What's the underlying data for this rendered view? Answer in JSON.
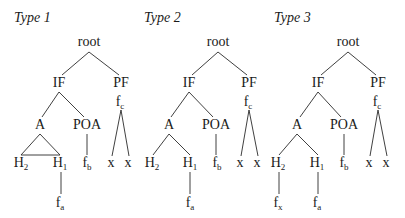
{
  "diagram": {
    "trees": [
      {
        "label": "Type 1",
        "label_pos": [
          14,
          22
        ],
        "nodes": [
          {
            "id": "root",
            "text": "root",
            "sub": "",
            "x": 89,
            "y": 46
          },
          {
            "id": "IF",
            "text": "IF",
            "sub": "",
            "x": 59,
            "y": 87
          },
          {
            "id": "PF",
            "text": "PF",
            "sub": "",
            "x": 121,
            "y": 87
          },
          {
            "id": "fc",
            "text": "f",
            "sub": "c",
            "x": 120,
            "y": 106
          },
          {
            "id": "A",
            "text": "A",
            "sub": "",
            "x": 40,
            "y": 129
          },
          {
            "id": "POA",
            "text": "POA",
            "sub": "",
            "x": 87,
            "y": 129
          },
          {
            "id": "H2",
            "text": "H",
            "sub": "2",
            "x": 21,
            "y": 167
          },
          {
            "id": "H1",
            "text": "H",
            "sub": "1",
            "x": 60,
            "y": 167
          },
          {
            "id": "fb",
            "text": "f",
            "sub": "b",
            "x": 87,
            "y": 167
          },
          {
            "id": "x1",
            "text": "x",
            "sub": "",
            "x": 111,
            "y": 167
          },
          {
            "id": "x2",
            "text": "x",
            "sub": "",
            "x": 128,
            "y": 167
          },
          {
            "id": "fa",
            "text": "f",
            "sub": "a",
            "x": 60,
            "y": 207
          }
        ],
        "edges": [
          [
            89,
            52,
            62,
            75
          ],
          [
            89,
            52,
            119,
            75
          ],
          [
            59,
            92,
            42,
            117
          ],
          [
            59,
            92,
            84,
            117
          ],
          [
            40,
            134,
            21,
            155
          ],
          [
            40,
            134,
            60,
            155
          ],
          [
            21,
            155,
            60,
            155
          ],
          [
            87,
            134,
            87,
            155
          ],
          [
            121,
            110,
            112,
            156
          ],
          [
            121,
            110,
            129,
            156
          ],
          [
            61,
            172,
            61,
            194
          ]
        ]
      },
      {
        "label": "Type 2",
        "label_pos": [
          144,
          22
        ],
        "nodes": [
          {
            "id": "root",
            "text": "root",
            "sub": "",
            "x": 218,
            "y": 46
          },
          {
            "id": "IF",
            "text": "IF",
            "sub": "",
            "x": 189,
            "y": 87
          },
          {
            "id": "PF",
            "text": "PF",
            "sub": "",
            "x": 249,
            "y": 87
          },
          {
            "id": "fc",
            "text": "f",
            "sub": "c",
            "x": 248,
            "y": 106
          },
          {
            "id": "A",
            "text": "A",
            "sub": "",
            "x": 169,
            "y": 129
          },
          {
            "id": "POA",
            "text": "POA",
            "sub": "",
            "x": 216,
            "y": 129
          },
          {
            "id": "H2",
            "text": "H",
            "sub": "2",
            "x": 152,
            "y": 167
          },
          {
            "id": "H1",
            "text": "H",
            "sub": "1",
            "x": 190,
            "y": 167
          },
          {
            "id": "fb",
            "text": "f",
            "sub": "b",
            "x": 217,
            "y": 167
          },
          {
            "id": "x1",
            "text": "x",
            "sub": "",
            "x": 240,
            "y": 167
          },
          {
            "id": "x2",
            "text": "x",
            "sub": "",
            "x": 257,
            "y": 167
          },
          {
            "id": "fa",
            "text": "f",
            "sub": "a",
            "x": 190,
            "y": 207
          }
        ],
        "edges": [
          [
            218,
            52,
            192,
            75
          ],
          [
            218,
            52,
            247,
            75
          ],
          [
            189,
            92,
            171,
            117
          ],
          [
            189,
            92,
            213,
            117
          ],
          [
            169,
            134,
            153,
            155
          ],
          [
            169,
            134,
            190,
            155
          ],
          [
            216,
            134,
            216,
            155
          ],
          [
            249,
            110,
            241,
            156
          ],
          [
            249,
            110,
            258,
            156
          ],
          [
            190,
            172,
            190,
            194
          ]
        ]
      },
      {
        "label": "Type 3",
        "label_pos": [
          274,
          22
        ],
        "nodes": [
          {
            "id": "root",
            "text": "root",
            "sub": "",
            "x": 348,
            "y": 46
          },
          {
            "id": "IF",
            "text": "IF",
            "sub": "",
            "x": 318,
            "y": 87
          },
          {
            "id": "PF",
            "text": "PF",
            "sub": "",
            "x": 378,
            "y": 87
          },
          {
            "id": "fc",
            "text": "f",
            "sub": "c",
            "x": 377,
            "y": 106
          },
          {
            "id": "A",
            "text": "A",
            "sub": "",
            "x": 297,
            "y": 129
          },
          {
            "id": "POA",
            "text": "POA",
            "sub": "",
            "x": 344,
            "y": 129
          },
          {
            "id": "H2",
            "text": "H",
            "sub": "2",
            "x": 278,
            "y": 167
          },
          {
            "id": "H1",
            "text": "H",
            "sub": "1",
            "x": 317,
            "y": 167
          },
          {
            "id": "fb",
            "text": "f",
            "sub": "b",
            "x": 344,
            "y": 167
          },
          {
            "id": "x1",
            "text": "x",
            "sub": "",
            "x": 369,
            "y": 167
          },
          {
            "id": "x2",
            "text": "x",
            "sub": "",
            "x": 386,
            "y": 167
          },
          {
            "id": "fx",
            "text": "f",
            "sub": "x",
            "x": 278,
            "y": 207
          },
          {
            "id": "fa",
            "text": "f",
            "sub": "a",
            "x": 317,
            "y": 207
          }
        ],
        "edges": [
          [
            348,
            52,
            321,
            75
          ],
          [
            348,
            52,
            376,
            75
          ],
          [
            318,
            92,
            300,
            117
          ],
          [
            318,
            92,
            341,
            117
          ],
          [
            297,
            134,
            279,
            155
          ],
          [
            297,
            134,
            318,
            155
          ],
          [
            344,
            134,
            344,
            155
          ],
          [
            378,
            110,
            370,
            156
          ],
          [
            378,
            110,
            387,
            156
          ],
          [
            279,
            172,
            279,
            194
          ],
          [
            318,
            172,
            318,
            194
          ]
        ]
      }
    ]
  }
}
